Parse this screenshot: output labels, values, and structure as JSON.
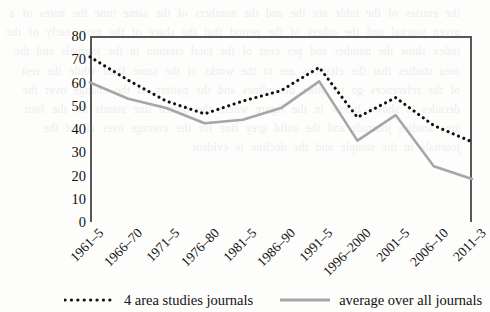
{
  "chart_data": {
    "type": "line",
    "title": "",
    "xlabel": "",
    "ylabel": "",
    "ylim": [
      0,
      80
    ],
    "ytick_step": 10,
    "yticks": [
      80,
      70,
      60,
      50,
      40,
      30,
      20,
      10,
      0
    ],
    "grid": false,
    "legend_position": "bottom",
    "categories": [
      "1961–5",
      "1966–70",
      "1971–5",
      "1976–80",
      "1981–5",
      "1986–90",
      "1991–5",
      "1996–2000",
      "2001–5",
      "2006–10",
      "2011–3"
    ],
    "series": [
      {
        "name": "4 area studies journals",
        "style": "dotted",
        "color": "#111111",
        "values": [
          71,
          61,
          52,
          46.5,
          52,
          56.5,
          66.5,
          45,
          53.5,
          41.5,
          34.5
        ]
      },
      {
        "name": "average over all journals",
        "style": "solid",
        "color": "#a6a6a6",
        "values": [
          60,
          53,
          49,
          42.5,
          44,
          49,
          60.5,
          35,
          46,
          24,
          18.5
        ]
      }
    ]
  },
  "legend": {
    "items": [
      {
        "label": "4 area studies journals",
        "marker": "dotted-line-swatch"
      },
      {
        "label": "average over all journals",
        "marker": "solid-line-swatch"
      }
    ]
  },
  "background_text": "the entries of the table are the and the numbers of the same time the notes of a given journal and the others of the period that the share of the more early of the index show the number and per cent of the total citation in the journals and the area studies that the citations are to the works of the same field while the rest of the references go to other disciplines and the pattern of the change over the decades is shown below in the figure where the dotted line stands for the four area studies journals and the solid grey line for the average over all of the journals in the sample and the decline is evident"
}
